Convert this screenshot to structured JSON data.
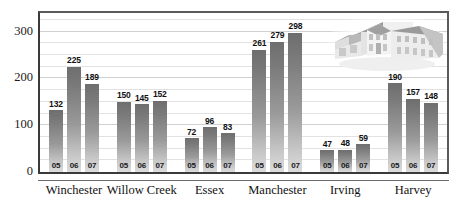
{
  "chart_data": {
    "type": "bar",
    "title": "",
    "subtitle": "",
    "xlabel": "",
    "ylabel": "",
    "ylim": [
      0,
      340
    ],
    "grid": true,
    "legend_position": "none",
    "y_ticks": [
      0,
      100,
      200,
      300
    ],
    "y_minor_interval": 25,
    "categories": [
      "Winchester",
      "Willow Creek",
      "Essex",
      "Manchester",
      "Irving",
      "Harvey"
    ],
    "x": [
      "05",
      "06",
      "07"
    ],
    "series": [
      {
        "name": "05",
        "values": [
          132,
          150,
          72,
          261,
          47,
          190
        ]
      },
      {
        "name": "06",
        "values": [
          225,
          145,
          96,
          279,
          48,
          157
        ]
      },
      {
        "name": "07",
        "values": [
          189,
          152,
          83,
          298,
          59,
          148
        ]
      }
    ],
    "groups": [
      {
        "label": "Winchester",
        "bars": [
          {
            "year": "05",
            "value": 132
          },
          {
            "year": "06",
            "value": 225
          },
          {
            "year": "07",
            "value": 189
          }
        ]
      },
      {
        "label": "Willow Creek",
        "bars": [
          {
            "year": "05",
            "value": 150
          },
          {
            "year": "06",
            "value": 145
          },
          {
            "year": "07",
            "value": 152
          }
        ]
      },
      {
        "label": "Essex",
        "bars": [
          {
            "year": "05",
            "value": 72
          },
          {
            "year": "06",
            "value": 96
          },
          {
            "year": "07",
            "value": 83
          }
        ]
      },
      {
        "label": "Manchester",
        "bars": [
          {
            "year": "05",
            "value": 261
          },
          {
            "year": "06",
            "value": 279
          },
          {
            "year": "07",
            "value": 298
          }
        ]
      },
      {
        "label": "Irving",
        "bars": [
          {
            "year": "05",
            "value": 47
          },
          {
            "year": "06",
            "value": 48
          },
          {
            "year": "07",
            "value": 59
          }
        ]
      },
      {
        "label": "Harvey",
        "bars": [
          {
            "year": "05",
            "value": 190
          },
          {
            "year": "06",
            "value": 157
          },
          {
            "year": "07",
            "value": 148
          }
        ]
      }
    ],
    "annotations": [
      {
        "name": "house-illustration",
        "type": "image",
        "description": "house-graphic"
      }
    ],
    "colors": {
      "bar_top": "#6e6e6e",
      "bar_bottom": "#dcdcdc",
      "gridline": "#e2e2e2",
      "frame": "#3a3a3a",
      "text": "#111111",
      "background": "#ffffff",
      "house_fill": "#e8e8e8",
      "house_shade": "#b4b4b4"
    }
  }
}
